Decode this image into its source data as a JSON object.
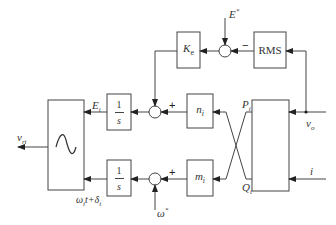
{
  "diagram": {
    "type": "block diagram",
    "blocks": {
      "ke": {
        "label": "K",
        "sub": "e"
      },
      "rms": {
        "label": "RMS"
      },
      "int_top": {
        "num": "1",
        "den": "s"
      },
      "int_bottom": {
        "num": "1",
        "den": "s"
      },
      "n": {
        "label": "n",
        "sub": "i"
      },
      "m": {
        "label": "m",
        "sub": "i"
      },
      "sine": {
        "icon": "sine-wave-icon"
      },
      "power_calc": {
        "label": ""
      }
    },
    "signals": {
      "e_ref": "E",
      "e_ref_sup": "*",
      "omega_ref": "ω",
      "omega_ref_sup": "*",
      "e_i": "E",
      "e_i_sub": "i",
      "phase": "ω",
      "phase_sub": "i",
      "phase_rest": "t+δ",
      "phase_sub2": "i",
      "v_ri": "v",
      "v_ri_sub": "ri",
      "p_i": "P",
      "p_i_sub": "i",
      "q_i": "Q",
      "q_i_sub": "i",
      "v_o": "v",
      "v_o_sub": "o",
      "i": "i"
    },
    "signs": {
      "top_sum_minus": "−",
      "mid_sum_plus": "+",
      "bottom_sum_plus": "+"
    },
    "colors": {
      "line": "#444444",
      "background": "#ffffff"
    }
  }
}
